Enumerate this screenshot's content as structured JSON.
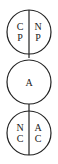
{
  "diagram": {
    "top_circle": {
      "left": {
        "line1": "C",
        "line2": "P"
      },
      "right": {
        "line1": "N",
        "line2": "P"
      }
    },
    "middle_circle": {
      "label": "A"
    },
    "bottom_circle": {
      "left": {
        "line1": "N",
        "line2": "C"
      },
      "right": {
        "line1": "A",
        "line2": "C"
      }
    },
    "stroke_color": "#222222"
  }
}
